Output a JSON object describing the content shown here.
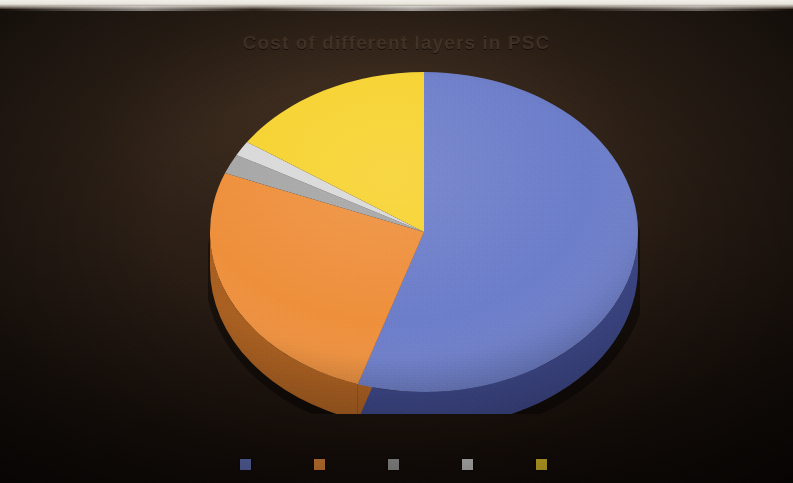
{
  "photo": {
    "width": 793,
    "height": 483,
    "background_color": "#241a14",
    "top_edge_color": "#f2efe9"
  },
  "chart_data": {
    "type": "pie",
    "title": "Cost of different layers in PSC",
    "subtitle": "",
    "xlabel": "",
    "ylabel": "",
    "three_d": true,
    "start_angle": 0,
    "direction": "clockwise",
    "legend_position": "bottom",
    "grid": false,
    "labels": [
      "Series 1",
      "Series 2",
      "Series 3",
      "Series 4",
      "Series 5"
    ],
    "values": [
      55,
      26,
      2,
      1.5,
      15.5
    ],
    "colors": [
      "#6c7dca",
      "#ef8f3c",
      "#a6a6a6",
      "#d9d9d9",
      "#f7d330"
    ],
    "side_colors": [
      "#3c4684",
      "#a85f22",
      "#6e6e6e",
      "#8f8f8f",
      "#a98e16"
    ],
    "slices": [
      {
        "label": "Series 1",
        "value": 55,
        "color": "#6c7dca",
        "side_color": "#3c4684"
      },
      {
        "label": "Series 2",
        "value": 26,
        "color": "#ef8f3c",
        "side_color": "#a85f22"
      },
      {
        "label": "Series 3",
        "value": 2,
        "color": "#a6a6a6",
        "side_color": "#6e6e6e"
      },
      {
        "label": "Series 4",
        "value": 1.5,
        "color": "#d9d9d9",
        "side_color": "#8f8f8f"
      },
      {
        "label": "Series 5",
        "value": 15.5,
        "color": "#f7d330",
        "side_color": "#a98e16"
      }
    ]
  },
  "legend": {
    "items": [
      {
        "label": "",
        "color": "#6c7dca"
      },
      {
        "label": "",
        "color": "#ef8f3c"
      },
      {
        "label": "",
        "color": "#a6a6a6"
      },
      {
        "label": "",
        "color": "#d9d9d9"
      },
      {
        "label": "",
        "color": "#f7d330"
      }
    ]
  }
}
